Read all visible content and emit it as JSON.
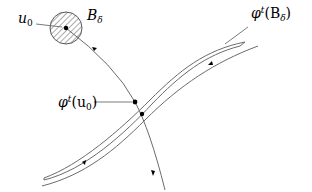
{
  "diagram": {
    "labels": {
      "initial_point": "u",
      "initial_point_sub": "0",
      "ball": "B",
      "ball_sub": "δ",
      "image_of_ball_phi": "φ",
      "image_of_ball_sup": "t",
      "image_of_ball_arg_open": "(B",
      "image_of_ball_sub": "δ",
      "image_of_ball_close": ")",
      "image_of_point_phi": "φ",
      "image_of_point_sup": "t",
      "image_of_point_arg_open": "(u",
      "image_of_point_sub": "0",
      "image_of_point_close": ")"
    },
    "colors": {
      "stroke": "#6b6b6b",
      "ink": "#000000"
    }
  }
}
